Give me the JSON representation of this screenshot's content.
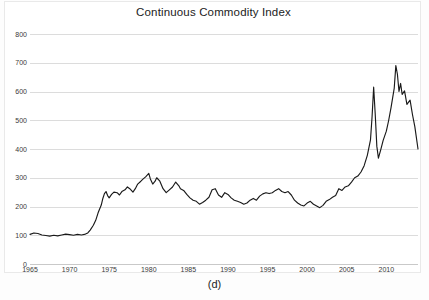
{
  "figure": {
    "caption": "(d)"
  },
  "chart_data": {
    "type": "line",
    "title": "Continuous Commodity Index",
    "xlabel": "",
    "ylabel": "",
    "xlim": [
      1965,
      2014
    ],
    "ylim": [
      0,
      800
    ],
    "grid": true,
    "legend": null,
    "line_color": "#1a1a1a",
    "gridline_color": "#dcdcdc",
    "y_ticks": [
      0,
      100,
      200,
      300,
      400,
      500,
      600,
      700,
      800
    ],
    "y_tick_labels": [
      "0",
      "100",
      "200",
      "300",
      "400",
      "500",
      "600",
      "700",
      "800"
    ],
    "x_ticks": [
      1965,
      1970,
      1975,
      1980,
      1985,
      1990,
      1995,
      2000,
      2005,
      2010
    ],
    "x_tick_labels": [
      "1965",
      "1970",
      "1975",
      "1980",
      "1985",
      "1990",
      "1995",
      "2000",
      "2005",
      "2010"
    ],
    "series": [
      {
        "name": "Continuous Commodity Index",
        "x": [
          1965.0,
          1965.5,
          1966.0,
          1966.5,
          1967.0,
          1967.5,
          1968.0,
          1968.5,
          1969.0,
          1969.5,
          1970.0,
          1970.5,
          1971.0,
          1971.5,
          1972.0,
          1972.3,
          1972.6,
          1973.0,
          1973.3,
          1973.6,
          1974.0,
          1974.2,
          1974.4,
          1974.6,
          1974.8,
          1975.0,
          1975.3,
          1975.6,
          1976.0,
          1976.3,
          1976.6,
          1977.0,
          1977.3,
          1977.6,
          1978.0,
          1978.3,
          1978.6,
          1979.0,
          1979.3,
          1979.6,
          1980.0,
          1980.2,
          1980.5,
          1980.8,
          1981.0,
          1981.4,
          1981.8,
          1982.2,
          1982.6,
          1983.0,
          1983.4,
          1983.8,
          1984.0,
          1984.4,
          1984.8,
          1985.2,
          1985.6,
          1986.0,
          1986.4,
          1986.8,
          1987.2,
          1987.6,
          1988.0,
          1988.4,
          1988.8,
          1989.2,
          1989.6,
          1990.0,
          1990.4,
          1990.8,
          1991.2,
          1991.6,
          1992.0,
          1992.4,
          1992.8,
          1993.2,
          1993.6,
          1994.0,
          1994.4,
          1994.8,
          1995.2,
          1995.6,
          1996.0,
          1996.4,
          1996.8,
          1997.2,
          1997.6,
          1998.0,
          1998.4,
          1998.8,
          1999.2,
          1999.6,
          2000.0,
          2000.4,
          2000.8,
          2001.2,
          2001.6,
          2002.0,
          2002.4,
          2002.8,
          2003.2,
          2003.6,
          2004.0,
          2004.4,
          2004.8,
          2005.2,
          2005.6,
          2006.0,
          2006.4,
          2006.8,
          2007.2,
          2007.6,
          2008.0,
          2008.2,
          2008.4,
          2008.6,
          2008.8,
          2009.0,
          2009.3,
          2009.6,
          2010.0,
          2010.3,
          2010.6,
          2011.0,
          2011.2,
          2011.4,
          2011.6,
          2011.8,
          2012.0,
          2012.3,
          2012.6,
          2013.0,
          2013.3,
          2013.6,
          2014.0
        ],
        "y": [
          103,
          108,
          106,
          101,
          99,
          97,
          100,
          98,
          101,
          104,
          102,
          100,
          103,
          101,
          104,
          108,
          118,
          135,
          152,
          178,
          205,
          228,
          245,
          252,
          238,
          230,
          242,
          250,
          248,
          240,
          252,
          258,
          268,
          262,
          250,
          262,
          278,
          288,
          296,
          303,
          315,
          296,
          278,
          288,
          300,
          288,
          262,
          248,
          258,
          268,
          285,
          272,
          262,
          256,
          242,
          230,
          222,
          218,
          208,
          214,
          222,
          232,
          258,
          262,
          240,
          232,
          248,
          242,
          230,
          222,
          218,
          214,
          208,
          212,
          222,
          228,
          222,
          236,
          244,
          248,
          245,
          248,
          256,
          262,
          252,
          248,
          252,
          240,
          222,
          212,
          205,
          202,
          212,
          218,
          208,
          202,
          196,
          204,
          218,
          224,
          232,
          238,
          262,
          256,
          268,
          272,
          285,
          300,
          306,
          320,
          342,
          378,
          432,
          512,
          615,
          520,
          410,
          368,
          398,
          430,
          462,
          500,
          545,
          612,
          690,
          660,
          600,
          628,
          590,
          602,
          555,
          570,
          520,
          478,
          400
        ]
      }
    ],
    "annotations": [
      {
        "label": "1973-74 commodity boom",
        "approx_year": 1974,
        "approx_value": 250
      },
      {
        "label": "1980 peak",
        "approx_year": 1980,
        "approx_value": 315
      },
      {
        "label": "2008 spike",
        "approx_year": 2008.4,
        "approx_value": 615
      },
      {
        "label": "2008 crash trough",
        "approx_year": 2009.0,
        "approx_value": 368
      },
      {
        "label": "2011 all-time high",
        "approx_year": 2011.2,
        "approx_value": 690
      },
      {
        "label": "series end",
        "approx_year": 2014,
        "approx_value": 400
      }
    ]
  }
}
